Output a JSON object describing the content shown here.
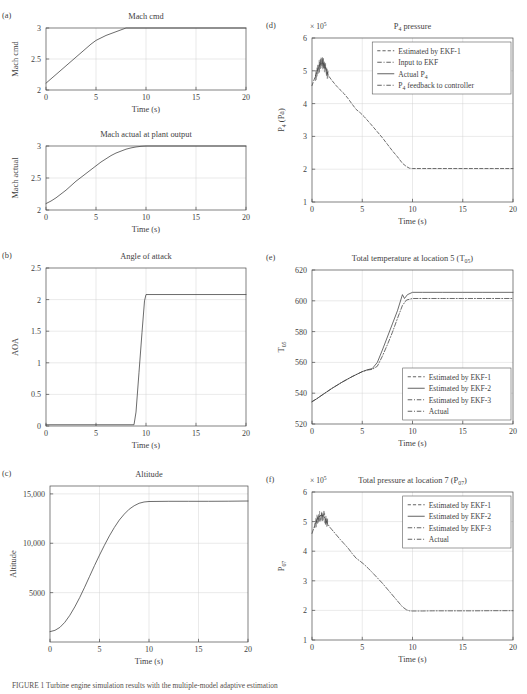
{
  "figure": {
    "background": "#ffffff",
    "curve_color": "#3b3b3b",
    "grid_color": "#cfcfcf",
    "frame_color": "#4a4a4a",
    "caption": "FIGURE 1   Turbine engine simulation results with the multiple-model adaptive estimation"
  },
  "common": {
    "xlabel": "Time (s)",
    "xticks": [
      "0",
      "5",
      "10",
      "15",
      "20"
    ],
    "xlim": [
      0,
      20
    ]
  },
  "chart_data": [
    {
      "id": "a1",
      "panel_label": "(a)",
      "type": "line",
      "title": "Mach cmd",
      "xlabel": "Time (s)",
      "ylabel": "Mach cmd",
      "xlim": [
        0,
        20
      ],
      "ylim": [
        2,
        3
      ],
      "xticks": [
        "0",
        "5",
        "10",
        "15",
        "20"
      ],
      "yticks": [
        "2",
        "2.5",
        "3"
      ],
      "ytickvals": [
        2,
        2.5,
        3
      ],
      "grid": true,
      "series": [
        {
          "name": "Mach cmd",
          "style": "solid",
          "x": [
            0,
            0.5,
            1,
            1.5,
            2,
            2.5,
            3,
            3.5,
            4,
            4.5,
            5,
            5.5,
            6,
            6.5,
            7,
            7.5,
            8,
            9,
            10,
            12,
            14,
            16,
            18,
            20
          ],
          "y": [
            2.11,
            2.18,
            2.25,
            2.32,
            2.39,
            2.46,
            2.53,
            2.6,
            2.67,
            2.74,
            2.8,
            2.84,
            2.88,
            2.91,
            2.94,
            2.97,
            3.0,
            3.0,
            3.0,
            3.0,
            3.0,
            3.0,
            3.0,
            3.0
          ]
        }
      ]
    },
    {
      "id": "a2",
      "panel_label": "",
      "type": "line",
      "title": "Mach actual at plant output",
      "xlabel": "Time (s)",
      "ylabel": "Mach actual",
      "xlim": [
        0,
        20
      ],
      "ylim": [
        2,
        3
      ],
      "xticks": [
        "0",
        "5",
        "10",
        "15",
        "20"
      ],
      "yticks": [
        "2",
        "2.5",
        "3"
      ],
      "ytickvals": [
        2,
        2.5,
        3
      ],
      "grid": true,
      "series": [
        {
          "name": "Mach actual",
          "style": "solid",
          "x": [
            0,
            0.5,
            1,
            1.5,
            2,
            2.5,
            3,
            3.5,
            4,
            4.5,
            5,
            5.5,
            6,
            6.5,
            7,
            7.5,
            8,
            8.5,
            9,
            9.5,
            10,
            11,
            12,
            14,
            16,
            18,
            20
          ],
          "y": [
            2.1,
            2.14,
            2.19,
            2.25,
            2.31,
            2.38,
            2.45,
            2.51,
            2.57,
            2.63,
            2.69,
            2.75,
            2.8,
            2.85,
            2.89,
            2.92,
            2.95,
            2.97,
            2.985,
            2.995,
            3.0,
            3.0,
            3.0,
            3.0,
            3.0,
            3.0,
            3.0
          ]
        }
      ]
    },
    {
      "id": "b",
      "panel_label": "(b)",
      "type": "line",
      "title": "Angle of attack",
      "xlabel": "Time (s)",
      "ylabel": "AOA",
      "xlim": [
        0,
        20
      ],
      "ylim": [
        0,
        2.5
      ],
      "xticks": [
        "0",
        "5",
        "10",
        "15",
        "20"
      ],
      "yticks": [
        "0",
        "0.5",
        "1",
        "1.5",
        "2",
        "2.5"
      ],
      "ytickvals": [
        0,
        0.5,
        1,
        1.5,
        2,
        2.5
      ],
      "grid": true,
      "series": [
        {
          "name": "AOA",
          "style": "solid",
          "x": [
            0,
            2,
            4,
            6,
            8,
            8.8,
            9.0,
            9.3,
            9.6,
            9.85,
            10.0,
            11,
            13,
            15,
            17,
            20
          ],
          "y": [
            0.02,
            0.02,
            0.02,
            0.02,
            0.02,
            0.02,
            0.22,
            0.85,
            1.48,
            1.98,
            2.08,
            2.08,
            2.08,
            2.08,
            2.08,
            2.08
          ]
        }
      ]
    },
    {
      "id": "c",
      "panel_label": "(c)",
      "type": "line",
      "title": "Altitude",
      "xlabel": "Time (s)",
      "ylabel": "Altitude",
      "xlim": [
        0,
        20
      ],
      "ylim": [
        0,
        15800
      ],
      "xticks": [
        "0",
        "5",
        "10",
        "15",
        "20"
      ],
      "yticks": [
        "5000",
        "10,000",
        "15,000"
      ],
      "ytickvals": [
        5000,
        10000,
        15000
      ],
      "grid": true,
      "series": [
        {
          "name": "Altitude",
          "style": "solid",
          "x": [
            0,
            0.5,
            1,
            1.5,
            2,
            2.5,
            3,
            3.5,
            4,
            4.5,
            5,
            5.5,
            6,
            6.5,
            7,
            7.5,
            8,
            8.5,
            9,
            9.5,
            10,
            12,
            14,
            16,
            18,
            20
          ],
          "y": [
            1050,
            1180,
            1480,
            2000,
            2700,
            3550,
            4500,
            5550,
            6650,
            7750,
            8800,
            9800,
            10750,
            11600,
            12350,
            12950,
            13450,
            13800,
            14050,
            14180,
            14230,
            14250,
            14250,
            14250,
            14260,
            14280
          ]
        }
      ]
    },
    {
      "id": "d",
      "panel_label": "(d)",
      "type": "line",
      "title": "P₄ pressure",
      "title_base": "P",
      "title_sub": "4",
      "title_tail": " pressure",
      "xlabel": "Time (s)",
      "ylabel": "P₄ (Pa)",
      "ylabel_base": "P",
      "ylabel_sub": "4",
      "ylabel_tail": " (Pa)",
      "exponent": "× 10⁵",
      "xlim": [
        0,
        20
      ],
      "ylim": [
        1,
        6
      ],
      "xticks": [
        "0",
        "5",
        "10",
        "15",
        "20"
      ],
      "yticks": [
        "1",
        "2",
        "3",
        "4",
        "5",
        "6"
      ],
      "ytickvals": [
        1,
        2,
        3,
        4,
        5,
        6
      ],
      "grid": true,
      "legend_position": "top-right",
      "legend": [
        {
          "label": "Estimated by EKF-1",
          "style": "dashed"
        },
        {
          "label": "Input to EKF",
          "style": "dashdot"
        },
        {
          "label": "Actual P₄",
          "style": "solid"
        },
        {
          "label": "P₄ feedback to controller",
          "style": "dashdot"
        }
      ],
      "series": [
        {
          "name": "P4",
          "style": "dashed",
          "noise_band": {
            "x0": 0.35,
            "x1": 1.6,
            "amp": 0.32,
            "count": 46
          },
          "x": [
            0,
            0.2,
            0.4,
            0.6,
            0.8,
            1.0,
            1.2,
            1.4,
            1.6,
            1.8,
            2.0,
            2.4,
            2.8,
            3.2,
            3.6,
            4.0,
            4.4,
            4.8,
            5.2,
            5.6,
            6.0,
            6.5,
            7.0,
            7.5,
            8.0,
            8.5,
            9.0,
            9.4,
            9.7,
            10.0,
            11,
            12,
            14,
            16,
            18,
            20
          ],
          "y": [
            4.55,
            4.72,
            4.9,
            5.08,
            5.2,
            5.25,
            5.2,
            5.05,
            4.88,
            4.78,
            4.7,
            4.55,
            4.42,
            4.3,
            4.15,
            3.98,
            3.82,
            3.72,
            3.6,
            3.46,
            3.32,
            3.14,
            2.96,
            2.76,
            2.56,
            2.38,
            2.18,
            2.08,
            2.03,
            2.02,
            2.02,
            2.02,
            2.02,
            2.02,
            2.02,
            2.02
          ]
        }
      ]
    },
    {
      "id": "e",
      "panel_label": "(e)",
      "type": "line",
      "title": "Total temperature at location 5 (T₀₅)",
      "title_base": "Total temperature at location 5 (T",
      "title_sub": "05",
      "title_tail": ")",
      "xlabel": "Time (s)",
      "ylabel": "T₀₅",
      "ylabel_base": "T",
      "ylabel_sub": "05",
      "ylabel_tail": "",
      "xlim": [
        0,
        20
      ],
      "ylim": [
        520,
        620
      ],
      "xticks": [
        "0",
        "5",
        "10",
        "15",
        "20"
      ],
      "yticks": [
        "520",
        "540",
        "560",
        "580",
        "600",
        "620"
      ],
      "ytickvals": [
        520,
        540,
        560,
        580,
        600,
        620
      ],
      "grid": true,
      "legend_position": "bottom-right",
      "legend": [
        {
          "label": "Estimated by EKF-1",
          "style": "dashed"
        },
        {
          "label": "Estimated by EKF-2",
          "style": "solid"
        },
        {
          "label": "Estimated by EKF-3",
          "style": "dashdot"
        },
        {
          "label": "Actual",
          "style": "dashdot"
        }
      ],
      "series": [
        {
          "name": "EKF-2",
          "style": "solid",
          "x": [
            0,
            0.5,
            1,
            1.5,
            2,
            2.5,
            3,
            3.5,
            4,
            4.5,
            5,
            5.5,
            6,
            6.5,
            7,
            7.5,
            8,
            8.5,
            9.0,
            9.2,
            9.5,
            10,
            11,
            13,
            15,
            17,
            20
          ],
          "y": [
            534.5,
            536.5,
            538.8,
            541.0,
            543.2,
            545.2,
            547.2,
            549.0,
            550.8,
            552.4,
            554.0,
            555.2,
            556.0,
            560.0,
            568.0,
            576.5,
            585.0,
            593.5,
            604.0,
            601.5,
            604.0,
            605.5,
            605.5,
            605.5,
            605.5,
            605.5,
            605.5
          ]
        },
        {
          "name": "EKF-1/3/Actual",
          "style": "dashdot",
          "x": [
            0,
            0.5,
            1,
            1.5,
            2,
            2.5,
            3,
            3.5,
            4,
            4.5,
            5,
            5.5,
            6,
            6.5,
            7,
            7.5,
            8,
            8.5,
            9.0,
            9.4,
            10,
            11,
            13,
            15,
            17,
            20
          ],
          "y": [
            534.5,
            536.5,
            538.8,
            541.0,
            543.2,
            545.2,
            547.2,
            549.0,
            550.8,
            552.4,
            554.0,
            555.0,
            555.5,
            557.5,
            564.0,
            571.5,
            579.5,
            588.5,
            597.0,
            600.5,
            601.5,
            601.5,
            601.5,
            601.5,
            601.5,
            601.5
          ]
        }
      ]
    },
    {
      "id": "f",
      "panel_label": "(f)",
      "type": "line",
      "title": "Total pressure at location 7 (P₀₇)",
      "title_base": "Total pressure at location 7 (P",
      "title_sub": "07",
      "title_tail": ")",
      "xlabel": "Time (s)",
      "ylabel": "P₀₇",
      "ylabel_base": "P",
      "ylabel_sub": "07",
      "ylabel_tail": "",
      "exponent": "× 10⁵",
      "xlim": [
        0,
        20
      ],
      "ylim": [
        1,
        6
      ],
      "xticks": [
        "0",
        "5",
        "10",
        "15",
        "20"
      ],
      "yticks": [
        "1",
        "2",
        "3",
        "4",
        "5",
        "6"
      ],
      "ytickvals": [
        1,
        2,
        3,
        4,
        5,
        6
      ],
      "grid": true,
      "legend_position": "top-right",
      "legend": [
        {
          "label": "Estimated by EKF-1",
          "style": "dashed"
        },
        {
          "label": "Estimated by EKF-2",
          "style": "solid"
        },
        {
          "label": "Estimated by EKF-3",
          "style": "dashdot"
        },
        {
          "label": "Actual",
          "style": "dashdot"
        }
      ],
      "series": [
        {
          "name": "P07",
          "style": "dashdot",
          "noise_band": {
            "x0": 0.25,
            "x1": 1.55,
            "amp": 0.3,
            "count": 50
          },
          "x": [
            0,
            0.2,
            0.4,
            0.6,
            0.8,
            1.0,
            1.2,
            1.4,
            1.6,
            1.8,
            2.0,
            2.4,
            2.8,
            3.2,
            3.6,
            4.0,
            4.4,
            4.8,
            5.2,
            5.6,
            6.0,
            6.5,
            7.0,
            7.5,
            8.0,
            8.5,
            9.0,
            9.4,
            9.7,
            10.0,
            11,
            12,
            14,
            16,
            18,
            20
          ],
          "y": [
            4.6,
            4.8,
            4.98,
            5.12,
            5.2,
            5.22,
            5.16,
            5.04,
            4.9,
            4.8,
            4.72,
            4.56,
            4.4,
            4.25,
            4.1,
            3.92,
            3.76,
            3.66,
            3.55,
            3.42,
            3.28,
            3.1,
            2.92,
            2.72,
            2.52,
            2.32,
            2.12,
            2.02,
            1.985,
            1.98,
            1.98,
            1.985,
            1.985,
            1.985,
            1.99,
            1.99
          ]
        }
      ]
    }
  ]
}
